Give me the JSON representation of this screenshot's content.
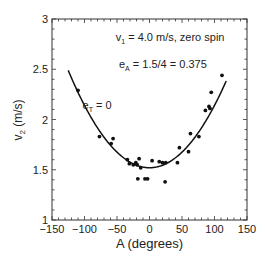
{
  "chart_data": {
    "type": "scatter",
    "title": "",
    "xlabel": "A (degrees)",
    "ylabel": "v2 (m/s)",
    "ylabel_main": "v",
    "ylabel_sub": "2",
    "ylabel_unit": " (m/s)",
    "xlim": [
      -150,
      150
    ],
    "ylim": [
      1,
      3
    ],
    "xticks": [
      -150,
      -100,
      -50,
      0,
      50,
      100,
      150
    ],
    "yticks": [
      1,
      1.5,
      2,
      2.5,
      3
    ],
    "ytick_labels": [
      "1",
      "1.5",
      "2",
      "2.5",
      "3"
    ],
    "grid": false,
    "legend": null,
    "annotations": [
      {
        "id": "v1",
        "main": "v",
        "sub": "1",
        "rest": " = 4.0 m/s, zero spin",
        "x": -52,
        "y": 2.78
      },
      {
        "id": "eA",
        "main": "e",
        "sub": "A",
        "rest": " = 1.5/4 = 0.375",
        "x": -47,
        "y": 2.51
      },
      {
        "id": "eT",
        "main": "e",
        "sub": "T",
        "rest": " = 0",
        "x": -103,
        "y": 2.1
      }
    ],
    "series": [
      {
        "name": "measured",
        "kind": "scatter",
        "color": "#111111",
        "points": [
          [
            -110,
            2.29
          ],
          [
            -77,
            1.83
          ],
          [
            -59,
            1.76
          ],
          [
            -56,
            1.81
          ],
          [
            -34,
            1.6
          ],
          [
            -31,
            1.56
          ],
          [
            -25,
            1.55
          ],
          [
            -21,
            1.57
          ],
          [
            -19,
            1.55
          ],
          [
            -16,
            1.61
          ],
          [
            -13.5,
            1.52
          ],
          [
            -18,
            1.41
          ],
          [
            -7,
            1.41
          ],
          [
            -3,
            1.41
          ],
          [
            4,
            1.59
          ],
          [
            15,
            1.58
          ],
          [
            20,
            1.57
          ],
          [
            25,
            1.57
          ],
          [
            24,
            1.38
          ],
          [
            43,
            1.57
          ],
          [
            46,
            1.72
          ],
          [
            60,
            1.68
          ],
          [
            63,
            1.86
          ],
          [
            76,
            1.83
          ],
          [
            86,
            2.09
          ],
          [
            91.5,
            2.13
          ],
          [
            93,
            2.11
          ],
          [
            95,
            2.27
          ],
          [
            111.5,
            2.44
          ]
        ]
      },
      {
        "name": "fit",
        "kind": "curve",
        "color": "#111111",
        "equation": "v2 = 1.52 + 6.2e-5 * A^2",
        "vertex": [
          0,
          1.52
        ],
        "coef": 6.2e-05,
        "x_range": [
          -125,
          118
        ]
      }
    ]
  }
}
